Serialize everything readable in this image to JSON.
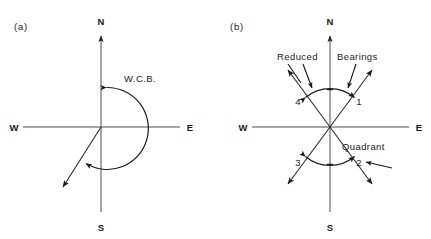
{
  "figure": {
    "background_color": "#ffffff",
    "ink_color": "#1a1a1a",
    "axis_color": "#4c4c4c",
    "width": 431,
    "height": 239
  },
  "panels": [
    {
      "tag": "(a)",
      "tag_x": 14,
      "tag_y": 30,
      "center_x": 101,
      "center_y": 127,
      "compass": {
        "north": "N",
        "south": "S",
        "east": "E",
        "west": "W"
      },
      "annotations": [
        {
          "name": "wcb-label",
          "text": "W.C.B.",
          "x": 124,
          "y": 82
        }
      ],
      "description": "Whole Circle Bearing measured clockwise from North"
    },
    {
      "tag": "(b)",
      "tag_x": 230,
      "tag_y": 30,
      "center_x": 330,
      "center_y": 127,
      "compass": {
        "north": "N",
        "south": "S",
        "east": "E",
        "west": "W"
      },
      "annotations": [
        {
          "name": "reduced-label",
          "text": "Reduced",
          "x": 277,
          "y": 60
        },
        {
          "name": "bearings-label",
          "text": "Bearings",
          "x": 337,
          "y": 60
        },
        {
          "name": "quadrant-label",
          "text": "Quadrant",
          "x": 342,
          "y": 150
        }
      ],
      "quadrant_numbers": [
        {
          "label": "1",
          "x": 359,
          "y": 105
        },
        {
          "label": "2",
          "x": 359,
          "y": 163
        },
        {
          "label": "3",
          "x": 296,
          "y": 163
        },
        {
          "label": "4",
          "x": 296,
          "y": 105
        }
      ],
      "description": "Reduced bearings referenced to N or S within each of four quadrants"
    }
  ]
}
